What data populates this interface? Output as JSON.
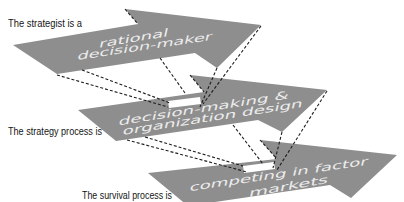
{
  "diagram": {
    "labels": [
      {
        "text": "The strategist is a"
      },
      {
        "text": "The strategy process is"
      },
      {
        "text": "The survival process is"
      }
    ],
    "arrows": [
      {
        "lines": [
          "rational",
          "decision-maker"
        ]
      },
      {
        "lines": [
          "decision-making &",
          "organization design"
        ]
      },
      {
        "lines": [
          "competing in factor",
          "markets"
        ]
      }
    ],
    "colors": {
      "arrow_fill": "#8e8e8e",
      "arrow_text": "#ececec",
      "label_text": "#151515",
      "connector_stroke": "#1e1e1e",
      "background": "#ffffff"
    }
  }
}
